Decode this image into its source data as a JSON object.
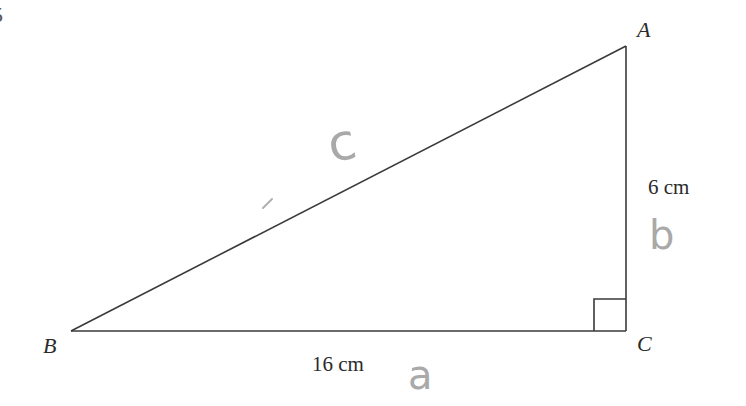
{
  "question_number_fragment": "5",
  "triangle": {
    "vertices": {
      "A": {
        "label": "A",
        "x": 626,
        "y": 46
      },
      "B": {
        "label": "B",
        "x": 71,
        "y": 331
      },
      "C": {
        "label": "C",
        "x": 626,
        "y": 331
      }
    },
    "right_angle_at": "C",
    "side_lengths": {
      "BC": "16 cm",
      "AC": "6 cm"
    },
    "line_color": "#3a3a3a"
  },
  "handwritten_annotations": {
    "hypotenuse": "c",
    "vertical_side": "b",
    "horizontal_side": "a",
    "color": "#a9a9a9"
  }
}
